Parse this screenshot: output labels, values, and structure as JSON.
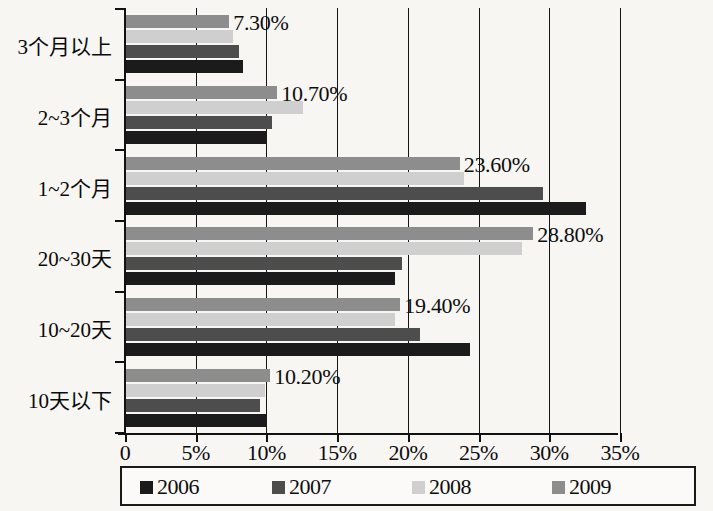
{
  "chart_data": {
    "type": "bar",
    "orientation": "horizontal",
    "title": "",
    "xlabel": "",
    "ylabel": "",
    "xlim": [
      0,
      35
    ],
    "xtick_labels": [
      "0",
      "5%",
      "10%",
      "15%",
      "20%",
      "25%",
      "30%",
      "35%"
    ],
    "xtick_values": [
      0,
      5,
      10,
      15,
      20,
      25,
      30,
      35
    ],
    "grid": true,
    "legend_position": "bottom",
    "categories": [
      "3个月以上",
      "2~3个月",
      "1~2个月",
      "20~30天",
      "10~20天",
      "10天以下"
    ],
    "series": [
      {
        "name": "2006",
        "color": "#1b1b1b",
        "values": [
          8.3,
          10.0,
          32.5,
          19.0,
          24.3,
          10.0
        ]
      },
      {
        "name": "2007",
        "color": "#4d4d4d",
        "values": [
          8.0,
          10.3,
          29.5,
          19.5,
          20.8,
          9.5
        ]
      },
      {
        "name": "2008",
        "color": "#cfcfcf",
        "values": [
          7.6,
          12.5,
          23.9,
          28.0,
          19.0,
          9.8
        ]
      },
      {
        "name": "2009",
        "color": "#8d8d8d",
        "values": [
          7.3,
          10.7,
          23.6,
          28.8,
          19.4,
          10.2
        ]
      }
    ],
    "data_labels": [
      {
        "category": "3个月以上",
        "series": "2009",
        "text": "7.30%"
      },
      {
        "category": "2~3个月",
        "series": "2009",
        "text": "10.70%"
      },
      {
        "category": "1~2个月",
        "series": "2009",
        "text": "23.60%"
      },
      {
        "category": "20~30天",
        "series": "2009",
        "text": "28.80%"
      },
      {
        "category": "10~20天",
        "series": "2009",
        "text": "19.40%"
      },
      {
        "category": "10天以下",
        "series": "2009",
        "text": "10.20%"
      }
    ]
  },
  "legend": {
    "items": [
      {
        "label": "2006",
        "color": "#1b1b1b"
      },
      {
        "label": "2007",
        "color": "#4d4d4d"
      },
      {
        "label": "2008",
        "color": "#cfcfcf"
      },
      {
        "label": "2009",
        "color": "#8d8d8d"
      }
    ]
  }
}
